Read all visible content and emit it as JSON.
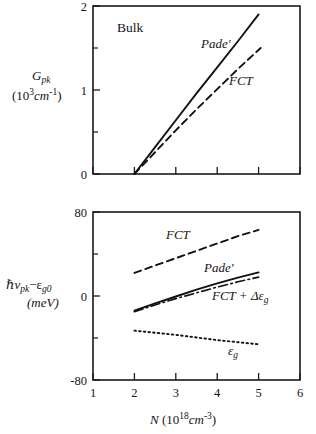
{
  "figure": {
    "panel_top_label": "Bulk"
  },
  "chart_data": [
    {
      "type": "line",
      "id": "top-panel",
      "title": "Bulk",
      "xlabel": "N (10^18 cm^-3)",
      "ylabel": "G_pk (10^3 cm^-1)",
      "ylabel_main": "G",
      "ylabel_main_sub": "pk",
      "ylabel_unit_pre": "(10",
      "ylabel_unit_sup": "3",
      "ylabel_unit_mid": "cm",
      "ylabel_unit_sup2": "-1",
      "ylabel_unit_post": ")",
      "xlim": [
        1,
        6
      ],
      "ylim": [
        0,
        2
      ],
      "xticks": [
        1,
        2,
        3,
        4,
        5,
        6
      ],
      "xticklabels": [
        "",
        "",
        "",
        "",
        "",
        ""
      ],
      "yticks": [
        0,
        1,
        2
      ],
      "yticklabels": [
        "0",
        "1",
        "2"
      ],
      "yminorticks": [
        0.5,
        1.5
      ],
      "grid": false,
      "legend": "inline-annotations",
      "series": [
        {
          "name": "Pade'",
          "style": "solid",
          "label": "Pade'",
          "label_x": 3.55,
          "label_y": 1.62,
          "x": [
            2.0,
            2.5,
            3.0,
            3.5,
            4.0,
            4.5,
            5.0
          ],
          "y": [
            0.0,
            0.32,
            0.64,
            0.96,
            1.27,
            1.58,
            1.9
          ]
        },
        {
          "name": "FCT",
          "style": "dashed",
          "label": "FCT",
          "label_x": 4.05,
          "label_y": 1.18,
          "x": [
            2.0,
            2.5,
            3.0,
            3.5,
            4.0,
            4.5,
            5.05
          ],
          "y": [
            0.0,
            0.26,
            0.52,
            0.77,
            1.01,
            1.25,
            1.5
          ]
        }
      ]
    },
    {
      "type": "line",
      "id": "bottom-panel",
      "title": "",
      "xlabel": "N (10^18 cm^-3)",
      "ylabel": "hv_pk - e_g0 (meV)",
      "ylabel_h": "ℏ",
      "ylabel_nu": "ν",
      "ylabel_nu_sub": "pk",
      "ylabel_minus": "−",
      "ylabel_eps": "ε",
      "ylabel_eps_sub": "g0",
      "ylabel_unit": "(meV)",
      "xlim": [
        1,
        6
      ],
      "ylim": [
        -80,
        80
      ],
      "xticks": [
        1,
        2,
        3,
        4,
        5,
        6
      ],
      "xticklabels": [
        "1",
        "2",
        "3",
        "4",
        "5",
        "6"
      ],
      "yticks": [
        -80,
        0,
        80
      ],
      "yticklabels": [
        "-80",
        "0",
        "80"
      ],
      "yminorticks": [
        -40,
        40
      ],
      "grid": false,
      "legend": "inline-annotations",
      "series": [
        {
          "name": "FCT",
          "style": "dashed",
          "label": "FCT",
          "label_x": 2.62,
          "label_y": 57,
          "x": [
            2.0,
            2.5,
            3.0,
            3.5,
            4.0,
            4.5,
            5.0
          ],
          "y": [
            22.0,
            29.0,
            36.0,
            43.0,
            50.0,
            57.0,
            63.0
          ]
        },
        {
          "name": "Pade'",
          "style": "solid",
          "label": "Pade'",
          "label_x": 3.55,
          "label_y": 26,
          "x": [
            2.0,
            2.5,
            3.0,
            3.5,
            4.0,
            4.5,
            5.0
          ],
          "y": [
            -14.0,
            -7.0,
            -0.5,
            6.0,
            12.0,
            17.5,
            22.5
          ]
        },
        {
          "name": "FCT + de_g",
          "style": "dashdot",
          "label_pre": "FCT + ",
          "label_delta": "Δε",
          "label_sub": "g",
          "label_x": 3.72,
          "label_y": 3,
          "x": [
            2.0,
            2.5,
            3.0,
            3.5,
            4.0,
            4.5,
            5.0
          ],
          "y": [
            -15.0,
            -8.5,
            -2.5,
            3.0,
            8.5,
            13.5,
            18.0
          ]
        },
        {
          "name": "e_g",
          "style": "dotted",
          "label_eps": "ε",
          "label_sub": "g",
          "label_x": 4.05,
          "label_y": -44,
          "x": [
            2.0,
            2.5,
            3.0,
            3.5,
            4.0,
            4.5,
            5.0
          ],
          "y": [
            -33.0,
            -35.0,
            -37.0,
            -39.5,
            -42.0,
            -44.0,
            -46.0
          ]
        }
      ]
    }
  ]
}
